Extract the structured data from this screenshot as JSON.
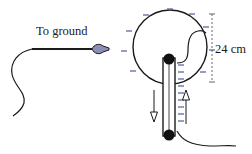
{
  "diagram": {
    "labels": {
      "ground": "To ground",
      "dimension": "24 cm"
    },
    "colors": {
      "line": "#1a1a1a",
      "charge": "#5a6aa0",
      "probe_tip": "#8a8fb8",
      "dimension_line": "#666666"
    },
    "charge_sign": "negative",
    "arrows": {
      "left": "down",
      "right": "up"
    }
  }
}
